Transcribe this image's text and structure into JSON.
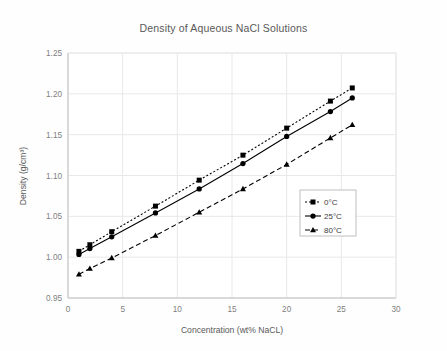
{
  "chart_data": {
    "type": "line",
    "title": "Density of Aqueous NaCl Solutions",
    "xlabel": "Concentration (wt% NaCL)",
    "ylabel": "Density (g/cm³)",
    "xlim": [
      0,
      30
    ],
    "ylim": [
      0.95,
      1.25
    ],
    "xticks": [
      0,
      5,
      10,
      15,
      20,
      25,
      30
    ],
    "yticks": [
      0.95,
      1.0,
      1.05,
      1.1,
      1.15,
      1.2,
      1.25
    ],
    "xtick_labels": [
      "0",
      "5",
      "10",
      "15",
      "20",
      "25",
      "30"
    ],
    "ytick_labels": [
      "0.95",
      "1.00",
      "1.05",
      "1.10",
      "1.15",
      "1.20",
      "1.25"
    ],
    "grid": true,
    "grid_axis": "both",
    "legend_position": "inside-right",
    "x": [
      1,
      2,
      4,
      8,
      12,
      16,
      20,
      24,
      26
    ],
    "series": [
      {
        "name": "0°C",
        "label": "0°C",
        "marker": "square",
        "linestyle": "dotted",
        "color": "#000000",
        "values": [
          1.0071,
          1.0152,
          1.0312,
          1.0625,
          1.0943,
          1.1249,
          1.158,
          1.1911,
          1.2072
        ]
      },
      {
        "name": "25°C",
        "label": "25°C",
        "marker": "circle",
        "linestyle": "solid",
        "color": "#000000",
        "values": [
          1.0034,
          1.0105,
          1.025,
          1.0541,
          1.0836,
          1.1146,
          1.1478,
          1.1783,
          1.195
        ]
      },
      {
        "name": "80°C",
        "label": "80°C",
        "marker": "triangle",
        "linestyle": "dashed",
        "color": "#000000",
        "values": [
          0.979,
          0.986,
          0.999,
          1.0265,
          1.055,
          1.0835,
          1.1135,
          1.146,
          1.162
        ]
      }
    ]
  },
  "legend": {
    "items": [
      {
        "label": "0°C"
      },
      {
        "label": "25°C"
      },
      {
        "label": "80°C"
      }
    ]
  },
  "colors": {
    "axis": "#bfbfbf",
    "grid": "#e8e8e8",
    "tick_label": "#7f7f7f",
    "title": "#595959",
    "series": "#000000",
    "background": "#fefefe"
  }
}
